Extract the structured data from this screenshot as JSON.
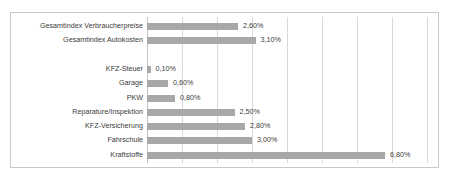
{
  "chart_data": {
    "type": "bar",
    "orientation": "horizontal",
    "title": "",
    "subtitle": "",
    "xlabel": "",
    "ylabel": "",
    "xlim": [
      0,
      8
    ],
    "grid": true,
    "grid_axis": "x",
    "legend": false,
    "value_format": "percent_comma",
    "bar_color": "#a8a8a8",
    "text_color": "#3b3b3b",
    "gridline_color": "#d9d9d9",
    "border_color": "#c9c9c9",
    "background_color": "#ffffff",
    "xticks": [
      0,
      1,
      2,
      3,
      4,
      5,
      6,
      7,
      8
    ],
    "categories": [
      "Gesamtindex Verbraucherpreise",
      "Gesamtindex Autokosten",
      "",
      "KFZ-Steuer",
      "Garage",
      "PKW",
      "Reparature/Inspektion",
      "KFZ-Versicherung",
      "Fahrschule",
      "Kraftstoffe"
    ],
    "values": [
      2.6,
      3.1,
      null,
      0.1,
      0.6,
      0.8,
      2.5,
      2.8,
      3.0,
      6.8
    ],
    "value_labels": [
      "2,60%",
      "3,10%",
      "",
      "0,10%",
      "0,60%",
      "0,80%",
      "2,50%",
      "2,80%",
      "3,00%",
      "6,80%"
    ],
    "points": [
      {
        "category": "Gesamtindex Verbraucherpreise",
        "value": 2.6,
        "label": "2,60%"
      },
      {
        "category": "Gesamtindex Autokosten",
        "value": 3.1,
        "label": "3,10%"
      },
      {
        "category": "",
        "value": null,
        "label": ""
      },
      {
        "category": "KFZ-Steuer",
        "value": 0.1,
        "label": "0,10%"
      },
      {
        "category": "Garage",
        "value": 0.6,
        "label": "0,60%"
      },
      {
        "category": "PKW",
        "value": 0.8,
        "label": "0,80%"
      },
      {
        "category": "Reparature/Inspektion",
        "value": 2.5,
        "label": "2,50%"
      },
      {
        "category": "KFZ-Versicherung",
        "value": 2.8,
        "label": "2,80%"
      },
      {
        "category": "Fahrschule",
        "value": 3.0,
        "label": "3,00%"
      },
      {
        "category": "Kraftstoffe",
        "value": 6.8,
        "label": "6,80%"
      }
    ]
  }
}
